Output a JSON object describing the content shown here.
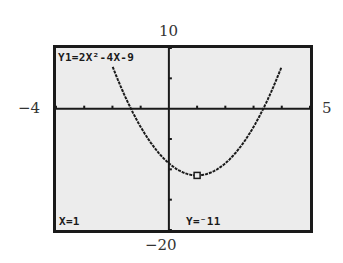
{
  "calculator": {
    "equation": "Y1=2X²-4X-9",
    "trace": {
      "x_label": "X=1",
      "y_label": "Y=⁻11",
      "x": 1,
      "y": -11
    }
  },
  "window": {
    "xmin": "−4",
    "xmax": "5",
    "ymin": "−20",
    "ymax": "10",
    "xmin_value": -4,
    "xmax_value": 5,
    "ymin_value": -20,
    "ymax_value": 10,
    "xscl": 1,
    "yscl": 5
  },
  "function": {
    "a": 2,
    "b": -4,
    "c": -9
  },
  "colors": {
    "screen_bg": "#ececec",
    "ink": "#1a1a1a"
  }
}
